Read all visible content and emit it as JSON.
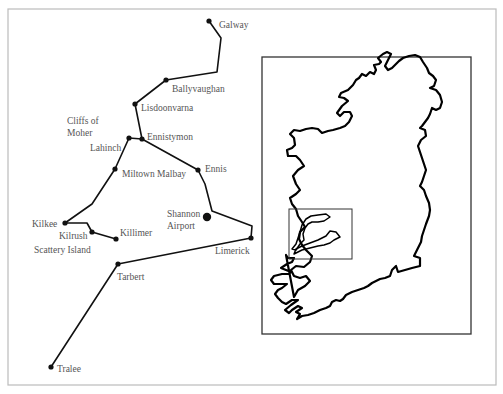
{
  "colors": {
    "frame": "#bbbbbb",
    "route": "#111111",
    "label": "#555555",
    "inset_frame": "#333333",
    "coast": "#000000"
  },
  "outer_frame": {
    "x": 8,
    "y": 9,
    "width": 488,
    "height": 376
  },
  "route": {
    "segments": [
      {
        "name": "galway-to-ennistymon",
        "points": [
          [
            209,
            21
          ],
          [
            221,
            38
          ],
          [
            217,
            72
          ],
          [
            166,
            80
          ],
          [
            135,
            104
          ],
          [
            142,
            139
          ]
        ]
      },
      {
        "name": "lahinch-to-ennistymon",
        "points": [
          [
            129,
            138
          ],
          [
            142,
            139
          ]
        ]
      },
      {
        "name": "lahinch-to-kilkee",
        "points": [
          [
            129,
            138
          ],
          [
            115,
            169
          ],
          [
            92,
            204
          ],
          [
            65,
            223
          ]
        ]
      },
      {
        "name": "kilkee-to-killimer",
        "points": [
          [
            65,
            223
          ],
          [
            87,
            223
          ],
          [
            92,
            232
          ],
          [
            116,
            239
          ]
        ]
      },
      {
        "name": "ennistymon-to-limerick",
        "points": [
          [
            142,
            139
          ],
          [
            198,
            170
          ],
          [
            205,
            184
          ],
          [
            212,
            211
          ],
          [
            252,
            226
          ],
          [
            251,
            238
          ]
        ]
      },
      {
        "name": "limerick-to-tralee",
        "points": [
          [
            251,
            238
          ],
          [
            118,
            264
          ],
          [
            51,
            367
          ]
        ]
      }
    ]
  },
  "places": [
    {
      "id": "galway",
      "label": "Galway",
      "x": 209,
      "y": 21,
      "lx": 219,
      "ly": 28,
      "major": false
    },
    {
      "id": "ballyvaughan",
      "label": "Ballyvaughan",
      "x": 166,
      "y": 80,
      "lx": 172,
      "ly": 92,
      "major": false
    },
    {
      "id": "lisdoonvarna",
      "label": "Lisdoonvarna",
      "x": 135,
      "y": 104,
      "lx": 141,
      "ly": 111,
      "major": false
    },
    {
      "id": "ennistymon",
      "label": "Ennistymon",
      "x": 142,
      "y": 139,
      "lx": 147,
      "ly": 140,
      "major": false
    },
    {
      "id": "lahinch",
      "label": "Lahinch",
      "x": 129,
      "y": 138,
      "lx": 90,
      "ly": 151,
      "major": false
    },
    {
      "id": "miltown-malbay",
      "label": "Miltown Malbay",
      "x": 115,
      "y": 169,
      "lx": 122,
      "ly": 177,
      "major": false
    },
    {
      "id": "ennis",
      "label": "Ennis",
      "x": 198,
      "y": 170,
      "lx": 205,
      "ly": 172,
      "major": false
    },
    {
      "id": "kilkee",
      "label": "Kilkee",
      "x": 65,
      "y": 223,
      "lx": 32,
      "ly": 227,
      "major": false
    },
    {
      "id": "kilrush",
      "label": "Kilrush",
      "x": 92,
      "y": 232,
      "lx": 59,
      "ly": 239,
      "major": false
    },
    {
      "id": "killimer",
      "label": "Killimer",
      "x": 116,
      "y": 239,
      "lx": 120,
      "ly": 236,
      "major": false
    },
    {
      "id": "shannon-airport",
      "label": "Shannon",
      "label2": "Airport",
      "x": 207,
      "y": 217,
      "lx": 167,
      "ly": 217,
      "major": true
    },
    {
      "id": "limerick",
      "label": "Limerick",
      "x": 251,
      "y": 238,
      "lx": 215,
      "ly": 254,
      "major": false
    },
    {
      "id": "tarbert",
      "label": "Tarbert",
      "x": 118,
      "y": 264,
      "lx": 117,
      "ly": 280,
      "major": false
    },
    {
      "id": "tralee",
      "label": "Tralee",
      "x": 51,
      "y": 367,
      "lx": 57,
      "ly": 372,
      "major": false
    }
  ],
  "annotations": [
    {
      "id": "cliffs-of-moher",
      "lines": [
        "Cliffs of",
        "Moher"
      ],
      "x": 67,
      "y": 124
    },
    {
      "id": "scattery-island",
      "lines": [
        "Scattery Island"
      ],
      "x": 34,
      "y": 253
    }
  ],
  "inset": {
    "frame": {
      "x": 262,
      "y": 57,
      "width": 209,
      "height": 277
    },
    "highlight_box": {
      "x": 289,
      "y": 209,
      "width": 63,
      "height": 50
    },
    "island_outline": "M294,297 L298,290 L305,286 L310,281 L306,276 L300,278 L294,276 L291,270 L296,266 L304,267 L310,262 L312,256 L306,250 L302,245 L299,239 L300,232 L305,227 L302,222 L298,216 L296,209 L292,204 L290,198 L296,194 L300,190 L296,184 L293,176 L298,170 L304,166 L300,160 L296,156 L288,156 L287,150 L292,148 L295,145 L294,138 L290,134 L294,130 L300,131 L306,129 L312,128 L318,129 L322,133 L328,131 L333,130 L340,128 L345,126 L349,122 L352,116 L350,112 L344,112 L340,116 L337,113 L342,106 L348,101 L344,98 L339,97 L341,93 L348,90 L353,85 L356,80 L359,78 L362,74 L366,76 L370,72 L374,74 L376,70 L374,65 L379,64 L381,62 L378,58 L383,54 L387,52 L391,54 L388,60 L385,66 L388,70 L392,68 L396,64 L399,61 L403,58 L409,56 L415,55 L420,57 L423,62 L427,68 L429,73 L433,76 L436,80 L434,86 L430,88 L436,90 L440,95 L442,102 L440,108 L436,110 L432,108 L430,114 L428,118 L425,122 L422,126 L420,128 L425,130 L426,136 L421,140 L418,146 L420,152 L422,158 L424,164 L426,170 L424,176 L422,182 L420,186 L424,190 L426,196 L429,203 L430,210 L429,216 L426,224 L424,230 L422,236 L421,242 L418,248 L416,252 L414,256 L420,258 L420,266 L412,268 L405,270 L398,272 L396,266 L392,270 L390,276 L385,278 L380,279 L376,281 L372,283 L368,286 L364,288 L358,290 L352,292 L346,295 L343,299 L340,301 L336,300 L332,302 L330,306 L326,308 L320,310 L314,313 L308,315 L302,316 L297,319 L300,314 L296,312 L302,308 L298,306 L292,310 L289,313 L285,310 L291,305 L298,300 L292,300 L286,304 L282,302 L278,298 L275,294 L278,290 L282,288 L287,284 L280,284 L274,284 L271,280 L274,276 L282,274 L289,274 L291,272 L286,270 L281,268 L287,264 L292,262 L294,258 L288,258 L286,255 Z",
    "lake_outline": "M296,250 L300,244 L304,240 L303,234 L305,228 L308,224 L312,222 L318,222 L324,221 L330,217 L326,214 L318,215 L311,216 L306,219 L302,225 L300,232 L298,238 L296,244 L292,249 Z",
    "estuary_outline": "M294,254 L302,250 L310,248 L318,246 L324,245 L330,243 L334,240 L340,237 L336,232 L330,231 L326,236 L318,240 L310,243 L302,246 L296,249 Z"
  }
}
